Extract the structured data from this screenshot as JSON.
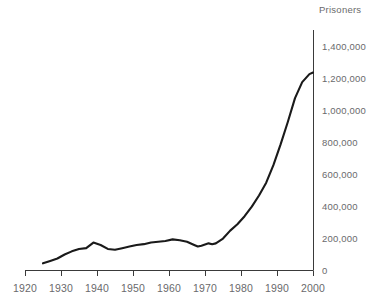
{
  "chart_data": {
    "type": "line",
    "title": "",
    "ylabel": "Prisoners",
    "xlabel": "",
    "xlim": [
      1920,
      2000
    ],
    "ylim": [
      0,
      1400000
    ],
    "grid": false,
    "legend": null,
    "x_tick_labels": [
      "1920",
      "1930",
      "1940",
      "1950",
      "1960",
      "1970",
      "1980",
      "1990",
      "2000"
    ],
    "x_ticks": [
      1920,
      1930,
      1940,
      1950,
      1960,
      1970,
      1980,
      1990,
      2000
    ],
    "y_tick_labels": [
      "0",
      "200,000",
      "400,000",
      "600,000",
      "800,000",
      "1,000,000",
      "1,200,000",
      "1,400,000"
    ],
    "y_ticks": [
      0,
      200000,
      400000,
      600000,
      800000,
      1000000,
      1200000,
      1400000
    ],
    "series": [
      {
        "name": "Prisoners",
        "color": "#1a1a1a",
        "x": [
          1925,
          1927,
          1929,
          1931,
          1933,
          1935,
          1937,
          1939,
          1941,
          1943,
          1945,
          1947,
          1949,
          1951,
          1953,
          1955,
          1957,
          1959,
          1961,
          1963,
          1965,
          1967,
          1968,
          1969,
          1971,
          1972,
          1973,
          1975,
          1977,
          1979,
          1981,
          1983,
          1985,
          1987,
          1989,
          1991,
          1993,
          1995,
          1997,
          1999,
          2000
        ],
        "values": [
          45000,
          60000,
          75000,
          100000,
          120000,
          135000,
          140000,
          175000,
          160000,
          135000,
          130000,
          140000,
          150000,
          160000,
          165000,
          175000,
          180000,
          185000,
          195000,
          190000,
          180000,
          160000,
          150000,
          155000,
          170000,
          165000,
          170000,
          200000,
          250000,
          290000,
          340000,
          400000,
          470000,
          550000,
          660000,
          790000,
          930000,
          1080000,
          1180000,
          1230000,
          1240000
        ]
      }
    ],
    "annotations": []
  },
  "layout": {
    "axis_color": "#3a3a3a",
    "tick_color": "#3a3a3a",
    "label_color": "#6a6a6c",
    "line_color": "#1a1a1a",
    "background": "#ffffff"
  }
}
